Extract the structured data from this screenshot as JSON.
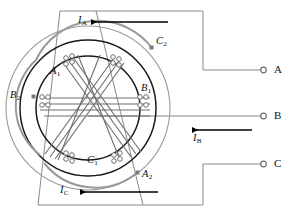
{
  "diagram": {
    "type": "electrical-winding-schematic",
    "colors": {
      "stator_outline": "#1a1a1a",
      "winding_wire": "#6e6e6e",
      "end_connection": "#8a8a8a",
      "lead_wire": "#8a8a8a",
      "current_arrow": "#000000",
      "terminal_dot": "#7a7a7a",
      "label_text": "#111111",
      "background": "#ffffff"
    },
    "center": {
      "x": 88,
      "y": 108
    },
    "circles": [
      {
        "name": "outer-end-ring",
        "radius": 82
      },
      {
        "name": "stator-outer-core",
        "radius": 68
      },
      {
        "name": "stator-bore",
        "radius": 52
      }
    ]
  },
  "coil_labels": {
    "a1": "A",
    "a1_sub": "1",
    "a2": "A",
    "a2_sub": "2",
    "b1": "B",
    "b1_sub": "1",
    "b2": "B",
    "b2_sub": "2",
    "c1": "C",
    "c1_sub": "1",
    "c2": "C",
    "c2_sub": "2"
  },
  "currents": [
    {
      "id": "ia",
      "symbol": "I",
      "sub": "A",
      "direction": "left",
      "phase": "A"
    },
    {
      "id": "ib",
      "symbol": "I",
      "sub": "B",
      "direction": "left",
      "phase": "B"
    },
    {
      "id": "ic",
      "symbol": "I",
      "sub": "C",
      "direction": "left",
      "phase": "C"
    }
  ],
  "terminals": [
    {
      "id": "terminal-a",
      "label": "A",
      "x": 272,
      "y": 70
    },
    {
      "id": "terminal-b",
      "label": "B",
      "x": 272,
      "y": 116
    },
    {
      "id": "terminal-c",
      "label": "C",
      "x": 272,
      "y": 164
    }
  ],
  "coil_points": [
    {
      "id": "a1-point",
      "label": "A1",
      "x": 58,
      "y": 72
    },
    {
      "id": "b1-point",
      "label": "B1",
      "x": 152,
      "y": 89
    },
    {
      "id": "b2-point",
      "label": "B2",
      "x": 20,
      "y": 97
    },
    {
      "id": "c1-point",
      "label": "C1",
      "x": 95,
      "y": 160
    },
    {
      "id": "c2-point",
      "label": "C2",
      "x": 158,
      "y": 42
    },
    {
      "id": "a2-point",
      "label": "A2",
      "x": 142,
      "y": 175
    }
  ]
}
